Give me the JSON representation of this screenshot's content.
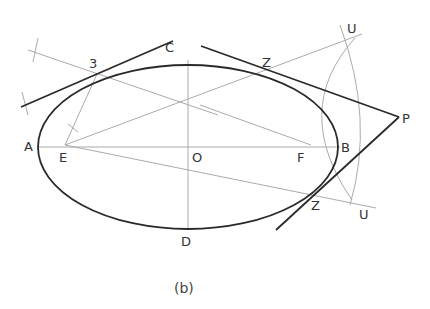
{
  "figure": {
    "caption": "(b)",
    "labels": {
      "A": "A",
      "B": "B",
      "C": "C",
      "D": "D",
      "O": "O",
      "E": "E",
      "F": "F",
      "P": "P",
      "Z_top": "Z",
      "Z_bottom": "Z",
      "U_top": "U",
      "U_bottom": "U",
      "point3": "3"
    },
    "colors": {
      "heavy_line": "#2a2a2a",
      "construction_line": "#9a9a9a",
      "label": "#333333"
    }
  }
}
